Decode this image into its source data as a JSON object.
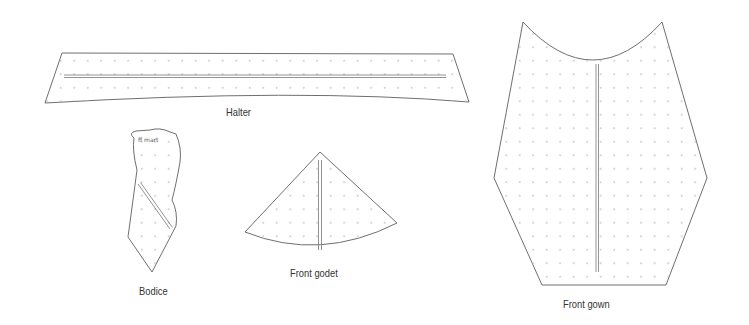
{
  "diagram": {
    "type": "sewing pattern pieces",
    "pieces": [
      {
        "id": "halter",
        "label": "Halter",
        "label_pos": [
          226,
          112
        ]
      },
      {
        "id": "bodice",
        "label": "Bodice",
        "label_pos": [
          139,
          289
        ],
        "note": "ff mart"
      },
      {
        "id": "front-godet",
        "label": "Front godet",
        "label_pos": [
          290,
          272
        ]
      },
      {
        "id": "front-gown",
        "label": "Front gown",
        "label_pos": [
          562,
          302
        ]
      }
    ],
    "colors": {
      "outline": "#6f6f6f",
      "grid_dot": "#c4c4c4",
      "grainline": "#777777",
      "background": "#ffffff",
      "label": "#333333"
    }
  }
}
